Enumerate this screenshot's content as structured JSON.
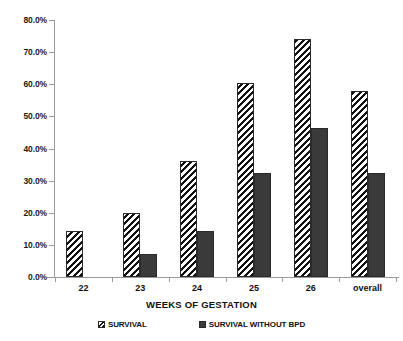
{
  "chart_data": {
    "type": "bar",
    "title": "",
    "xlabel": "WEEKS OF GESTATION",
    "ylabel": "",
    "categories": [
      "22",
      "23",
      "24",
      "25",
      "26",
      "overall"
    ],
    "series": [
      {
        "name": "SURVIVAL",
        "style": "diagonal-hatch",
        "color": "#111111",
        "values": [
          14.2,
          19.9,
          36.1,
          60.4,
          74.1,
          57.9
        ]
      },
      {
        "name": "SURVIVAL WITHOUT BPD",
        "style": "solid",
        "color": "#3a3a3a",
        "values": [
          null,
          7.2,
          14.3,
          32.4,
          46.4,
          32.4
        ]
      }
    ],
    "ylim": [
      0,
      80
    ],
    "y_ticks": [
      0,
      10,
      20,
      30,
      40,
      50,
      60,
      70,
      80
    ],
    "y_tick_labels": [
      "0.0%",
      "10.0%",
      "20.0%",
      "30.0%",
      "40.0%",
      "50.0%",
      "60.0%",
      "70.0%",
      "80.0%"
    ],
    "grid": false,
    "legend_position": "bottom",
    "value_suffix": "%"
  },
  "legend": {
    "entries": [
      {
        "label": "SURVIVAL",
        "swatch": "hatch-swatch-icon"
      },
      {
        "label": "SURVIVAL WITHOUT BPD",
        "swatch": "solid-swatch-icon"
      }
    ]
  },
  "axis": {
    "x_title": "WEEKS OF GESTATION"
  }
}
